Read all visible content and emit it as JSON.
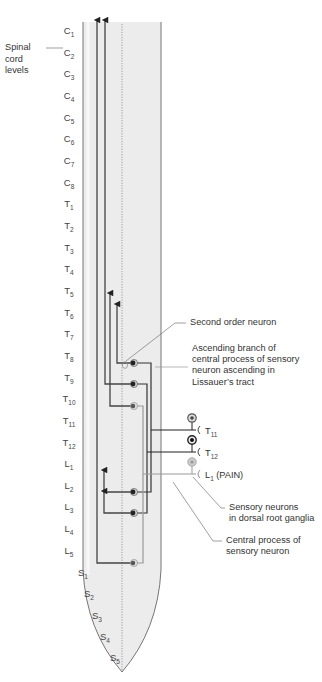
{
  "diagram": {
    "title_label": {
      "line1": "Spinal",
      "line2": "cord",
      "line3": "levels"
    },
    "levels": [
      {
        "letter": "C",
        "num": "1",
        "y": 48
      },
      {
        "letter": "C",
        "num": "2",
        "y": 70
      },
      {
        "letter": "C",
        "num": "3",
        "y": 91
      },
      {
        "letter": "C",
        "num": "4",
        "y": 113
      },
      {
        "letter": "C",
        "num": "5",
        "y": 135
      },
      {
        "letter": "C",
        "num": "6",
        "y": 156
      },
      {
        "letter": "C",
        "num": "7",
        "y": 178
      },
      {
        "letter": "C",
        "num": "8",
        "y": 200
      },
      {
        "letter": "T",
        "num": "1",
        "y": 221
      },
      {
        "letter": "T",
        "num": "2",
        "y": 243
      },
      {
        "letter": "T",
        "num": "3",
        "y": 265
      },
      {
        "letter": "T",
        "num": "4",
        "y": 286
      },
      {
        "letter": "T",
        "num": "5",
        "y": 308
      },
      {
        "letter": "T",
        "num": "6",
        "y": 330
      },
      {
        "letter": "T",
        "num": "7",
        "y": 351
      },
      {
        "letter": "T",
        "num": "8",
        "y": 373
      },
      {
        "letter": "T",
        "num": "9",
        "y": 395
      },
      {
        "letter": "T",
        "num": "10",
        "y": 416
      },
      {
        "letter": "T",
        "num": "11",
        "y": 438
      },
      {
        "letter": "T",
        "num": "12",
        "y": 460
      },
      {
        "letter": "L",
        "num": "1",
        "y": 481
      },
      {
        "letter": "L",
        "num": "2",
        "y": 503
      },
      {
        "letter": "L",
        "num": "3",
        "y": 524
      },
      {
        "letter": "L",
        "num": "4",
        "y": 546
      },
      {
        "letter": "L",
        "num": "5",
        "y": 568
      },
      {
        "letter": "S",
        "num": "1",
        "y": 590,
        "x": 78
      },
      {
        "letter": "S",
        "num": "2",
        "y": 611,
        "x": 84
      },
      {
        "letter": "S",
        "num": "3",
        "y": 633,
        "x": 92
      },
      {
        "letter": "S",
        "num": "4",
        "y": 654,
        "x": 100
      },
      {
        "letter": "S",
        "num": "5",
        "y": 675,
        "x": 110
      }
    ],
    "nerves": [
      {
        "letter": "T",
        "num": "11",
        "suffix": ""
      },
      {
        "letter": "T",
        "num": "12",
        "suffix": ""
      },
      {
        "letter": "L",
        "num": "1",
        "suffix": " (PAIN)"
      }
    ],
    "annotations": {
      "second_order": "Second order neuron",
      "ascending_branch": [
        "Ascending branch of",
        "central process of sensory",
        "neuron ascending in",
        "Lissauer’s tract"
      ],
      "sensory_neurons": [
        "Sensory neurons",
        "in dorsal root ganglia"
      ],
      "central_process": [
        "Central process of",
        "sensory neuron"
      ]
    },
    "colors": {
      "cord_fill": "#ececec",
      "cord_outline": "#666666",
      "pathway_dark": "#333333",
      "pathway_grey": "#9a9a9a",
      "leader_line": "#777777"
    }
  }
}
